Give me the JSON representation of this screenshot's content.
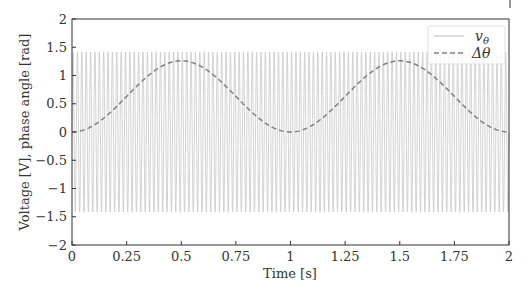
{
  "chart_data": {
    "type": "line",
    "title": "",
    "xlabel": "Time [s]",
    "ylabel": "Voltage [V], phase angle [rad]",
    "xlim": [
      0,
      2
    ],
    "ylim": [
      -2,
      2
    ],
    "grid": false,
    "legend_position": "upper right",
    "x_ticks": [
      0,
      0.25,
      0.5,
      0.75,
      1,
      1.25,
      1.5,
      1.75,
      2
    ],
    "x_tick_labels": [
      "0",
      "0.25",
      "0.5",
      "0.75",
      "1",
      "1.25",
      "1.5",
      "1.75",
      "2"
    ],
    "y_ticks": [
      -2,
      -1.5,
      -1,
      -0.5,
      0,
      0.5,
      1,
      1.5,
      2
    ],
    "y_tick_labels": [
      "−2",
      "−1.5",
      "−1",
      "−0.5",
      "0",
      "0.5",
      "1",
      "1.5",
      "2"
    ],
    "series": [
      {
        "name": "v_θ",
        "legend_label": "vθ",
        "style": "solid",
        "color": "#c8c8c8",
        "description": "Sinusoidal voltage, amplitude ≈ 1.414 (√2), frequency ≈ 50 Hz",
        "amplitude": 1.414,
        "frequency_hz": 50
      },
      {
        "name": "Δθ",
        "legend_label": "Δθ",
        "style": "dashed",
        "color": "#808080",
        "description": "Phase angle deviation, smooth periodic hump with period 1 s, min 0 at t=0,1,2, max ≈ 1.26 at t=0.5,1.5",
        "x": [
          0,
          0.125,
          0.25,
          0.375,
          0.5,
          0.625,
          0.75,
          0.875,
          1,
          1.125,
          1.25,
          1.375,
          1.5,
          1.625,
          1.75,
          1.875,
          2
        ],
        "values": [
          0,
          0.18,
          0.63,
          1.08,
          1.26,
          1.08,
          0.63,
          0.18,
          0,
          0.18,
          0.63,
          1.08,
          1.26,
          1.08,
          0.63,
          0.18,
          0
        ]
      }
    ]
  },
  "legend": {
    "entries": [
      {
        "label": "v",
        "subscript": "θ"
      },
      {
        "label": "Δθ",
        "subscript": ""
      }
    ]
  },
  "axes": {
    "xlabel": "Time [s]",
    "ylabel": "Voltage [V], phase angle [rad]"
  }
}
